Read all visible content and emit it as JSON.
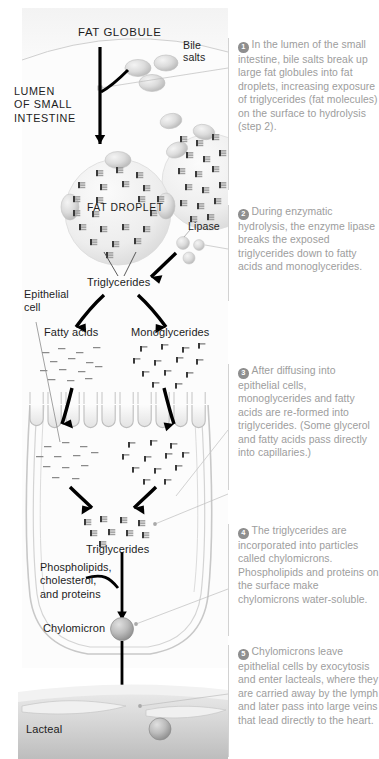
{
  "figure": {
    "accent_badge_color": "#8e8e8e",
    "step_text_color": "#9d9d9d",
    "label_color": "#1d1d1d",
    "rule_color": "#d2d2d2"
  },
  "diagram": {
    "labels": [
      {
        "id": "fat-globule",
        "text": "FAT GLOBULE"
      },
      {
        "id": "bile-salts",
        "text": "Bile\nsalts"
      },
      {
        "id": "lumen",
        "text": "LUMEN\nOF SMALL\nINTESTINE"
      },
      {
        "id": "fat-droplet",
        "text": "FAT DROPLET"
      },
      {
        "id": "lipase",
        "text": "Lipase"
      },
      {
        "id": "triglycerides-1",
        "text": "Triglycerides"
      },
      {
        "id": "epithelial-cell",
        "text": "Epithelial\ncell"
      },
      {
        "id": "fatty-acids",
        "text": "Fatty acids"
      },
      {
        "id": "monoglycerides",
        "text": "Monoglycerides"
      },
      {
        "id": "triglycerides-2",
        "text": "Triglycerides"
      },
      {
        "id": "phospholipids",
        "text": "Phospholipids,\ncholesterol,\nand proteins"
      },
      {
        "id": "chylomicron",
        "text": "Chylomicron"
      },
      {
        "id": "lacteal",
        "text": "Lacteal"
      }
    ]
  },
  "steps": [
    {
      "number": "1",
      "text": "In the lumen of the small intestine, bile salts break up large fat globules into fat droplets, increasing exposure of triglycerides (fat molecules) on the surface to hydrolysis (step 2)."
    },
    {
      "number": "2",
      "text": "During enzymatic hydrolysis, the enzyme lipase breaks the exposed triglycerides down to fatty acids and monoglycerides."
    },
    {
      "number": "3",
      "text": "After diffusing into epithelial cells, monoglycerides and fatty acids are re-formed into triglycerides. (Some glycerol and fatty acids pass directly into capillaries.)"
    },
    {
      "number": "4",
      "text": "The triglycerides are incorporated into particles called chylomicrons. Phospholipids and proteins on the surface make chylomicrons water-soluble."
    },
    {
      "number": "5",
      "text": "Chylomicrons leave epithelial cells by exocytosis and enter lacteals, where they are carried away by the lymph and later pass into large veins that lead directly to the heart."
    }
  ]
}
